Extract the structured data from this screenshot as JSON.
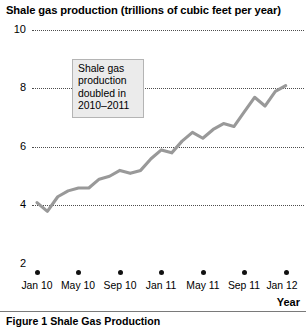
{
  "chart_data": {
    "type": "line",
    "title": "Shale gas production (trillions of cubic feet per year)",
    "xlabel": "Year",
    "ylabel": "",
    "ylim": [
      2,
      10
    ],
    "yticks": [
      2,
      4,
      6,
      8,
      10
    ],
    "ytick_labels": [
      "2",
      "4",
      "6",
      "8",
      "10"
    ],
    "grid": true,
    "legend": "none",
    "xtick_labels": [
      "Jan 10",
      "May 10",
      "Sep 10",
      "Jan 11",
      "May 11",
      "Sep 11",
      "Jan 12"
    ],
    "x": [
      "Jan 10",
      "Feb 10",
      "Mar 10",
      "Apr 10",
      "May 10",
      "Jun 10",
      "Jul 10",
      "Aug 10",
      "Sep 10",
      "Oct 10",
      "Nov 10",
      "Dec 10",
      "Jan 11",
      "Feb 11",
      "Mar 11",
      "Apr 11",
      "May 11",
      "Jun 11",
      "Jul 11",
      "Aug 11",
      "Sep 11",
      "Oct 11",
      "Nov 11",
      "Dec 11",
      "Jan 12"
    ],
    "values": [
      4.1,
      3.8,
      4.3,
      4.5,
      4.6,
      4.6,
      4.9,
      5.0,
      5.2,
      5.1,
      5.2,
      5.6,
      5.9,
      5.8,
      6.2,
      6.5,
      6.3,
      6.6,
      6.8,
      6.7,
      7.2,
      7.7,
      7.4,
      7.9,
      8.1
    ],
    "line_color": "#999999",
    "annotations": [
      {
        "text": "Shale gas production doubled in 2010–2011",
        "lines": [
          "Shale gas",
          "production",
          "doubled in",
          "2010–2011"
        ]
      }
    ]
  },
  "caption": "Figure 1 Shale Gas Production"
}
